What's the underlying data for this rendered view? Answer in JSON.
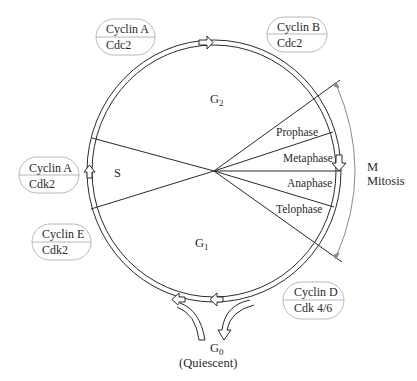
{
  "diagram": {
    "center": {
      "x": 214,
      "y": 171
    },
    "phases": {
      "g2": {
        "label": "G",
        "sub": "2"
      },
      "s": {
        "label": "S"
      },
      "g1": {
        "label": "G",
        "sub": "1"
      },
      "g0": {
        "label": "G",
        "sub": "0",
        "note": "(Quiescent)"
      }
    },
    "mitosis": {
      "label_m": "M",
      "label_mitosis": "Mitosis",
      "subphases": [
        "Prophase",
        "Metaphase",
        "Anaphase",
        "Telophase"
      ]
    },
    "complexes": [
      {
        "id": "cyclin-a-cdc2",
        "cyclin": "Cyclin A",
        "kinase": "Cdc2"
      },
      {
        "id": "cyclin-b-cdc2",
        "cyclin": "Cyclin B",
        "kinase": "Cdc2"
      },
      {
        "id": "cyclin-a-cdk2",
        "cyclin": "Cyclin A",
        "kinase": "Cdk2"
      },
      {
        "id": "cyclin-e-cdk2",
        "cyclin": "Cyclin E",
        "kinase": "Cdk2"
      },
      {
        "id": "cyclin-d-cdk46",
        "cyclin": "Cyclin D",
        "kinase": "Cdk 4/6"
      }
    ],
    "colors": {
      "line": "#2a2a2a",
      "pill_border": "#b8b8b8",
      "arc_arrow": "#8a8a8a"
    }
  }
}
